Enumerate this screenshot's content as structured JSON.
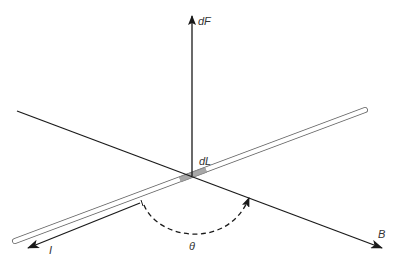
{
  "diagram": {
    "labels": {
      "force": "dF",
      "element": "dL",
      "current": "I",
      "field": "B",
      "angle": "θ"
    },
    "colors": {
      "line": "#1a1a1a",
      "wire_outline": "#555555",
      "element_fill": "#a8a8a8",
      "label": "#333333",
      "background": "#ffffff"
    }
  }
}
